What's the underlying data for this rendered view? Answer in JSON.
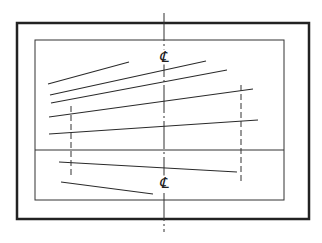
{
  "diagram": {
    "type": "technical-line-drawing",
    "colors": {
      "background": "#ffffff",
      "ink": "#222222"
    },
    "outer_frame": {
      "x": 17,
      "y": 23,
      "w": 292,
      "h": 196,
      "stroke": 2.5
    },
    "inner_frame": {
      "x": 35,
      "y": 40,
      "w": 249,
      "h": 160,
      "stroke": 1
    },
    "center_line": {
      "x": 164,
      "y1": 13,
      "y2": 232,
      "style": "dash-dot"
    },
    "center_labels": [
      {
        "text": "℄",
        "x": 164,
        "y": 57
      },
      {
        "text": "℄",
        "x": 164,
        "y": 183
      }
    ],
    "horizontal_line": {
      "x1": 35,
      "y1": 150,
      "x2": 284,
      "y2": 150
    },
    "oblique_lines": [
      {
        "x1": 48,
        "y1": 84,
        "x2": 129,
        "y2": 62
      },
      {
        "x1": 50,
        "y1": 95,
        "x2": 206,
        "y2": 61
      },
      {
        "x1": 51,
        "y1": 103,
        "x2": 227,
        "y2": 70
      },
      {
        "x1": 49,
        "y1": 117,
        "x2": 253,
        "y2": 89
      },
      {
        "x1": 49,
        "y1": 134,
        "x2": 258,
        "y2": 120
      },
      {
        "x1": 59,
        "y1": 162,
        "x2": 237,
        "y2": 172
      },
      {
        "x1": 61,
        "y1": 182,
        "x2": 153,
        "y2": 194
      }
    ],
    "dashed_verticals": [
      {
        "x": 71,
        "y1": 106,
        "y2": 178
      },
      {
        "x": 241,
        "y1": 85,
        "y2": 184
      }
    ]
  }
}
